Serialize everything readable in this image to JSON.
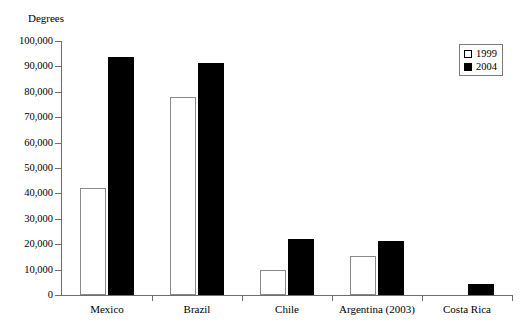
{
  "chart_data": {
    "type": "bar",
    "title": "",
    "subtitle": "",
    "xlabel": "",
    "ylabel": "Degrees",
    "ylim": [
      0,
      100000
    ],
    "ytick_step": 10000,
    "grid": false,
    "legend_position": "top-right",
    "categories": [
      "Mexico",
      "Brazil",
      "Chile",
      "Argentina (2003)",
      "Costa Rica"
    ],
    "ytick_labels": [
      "100,000",
      "90,000",
      "80,000",
      "70,000",
      "60,000",
      "50,000",
      "40,000",
      "30,000",
      "20,000",
      "10,000",
      "0"
    ],
    "ytick_values": [
      100000,
      90000,
      80000,
      70000,
      60000,
      50000,
      40000,
      30000,
      20000,
      10000,
      0
    ],
    "series": [
      {
        "name": "1999",
        "color": "#ffffff",
        "edge_color": "#8a8a8a",
        "values": [
          42300,
          77800,
          9900,
          15300,
          0
        ]
      },
      {
        "name": "2004",
        "color": "#000000",
        "edge_color": "#000000",
        "values": [
          93700,
          91500,
          22100,
          21300,
          4300
        ]
      }
    ]
  },
  "legend": {
    "entries": [
      {
        "label": "1999",
        "swatch": "square-outline-white"
      },
      {
        "label": "2004",
        "swatch": "square-filled-black"
      }
    ]
  },
  "axes": {
    "y_title": "Degrees"
  }
}
